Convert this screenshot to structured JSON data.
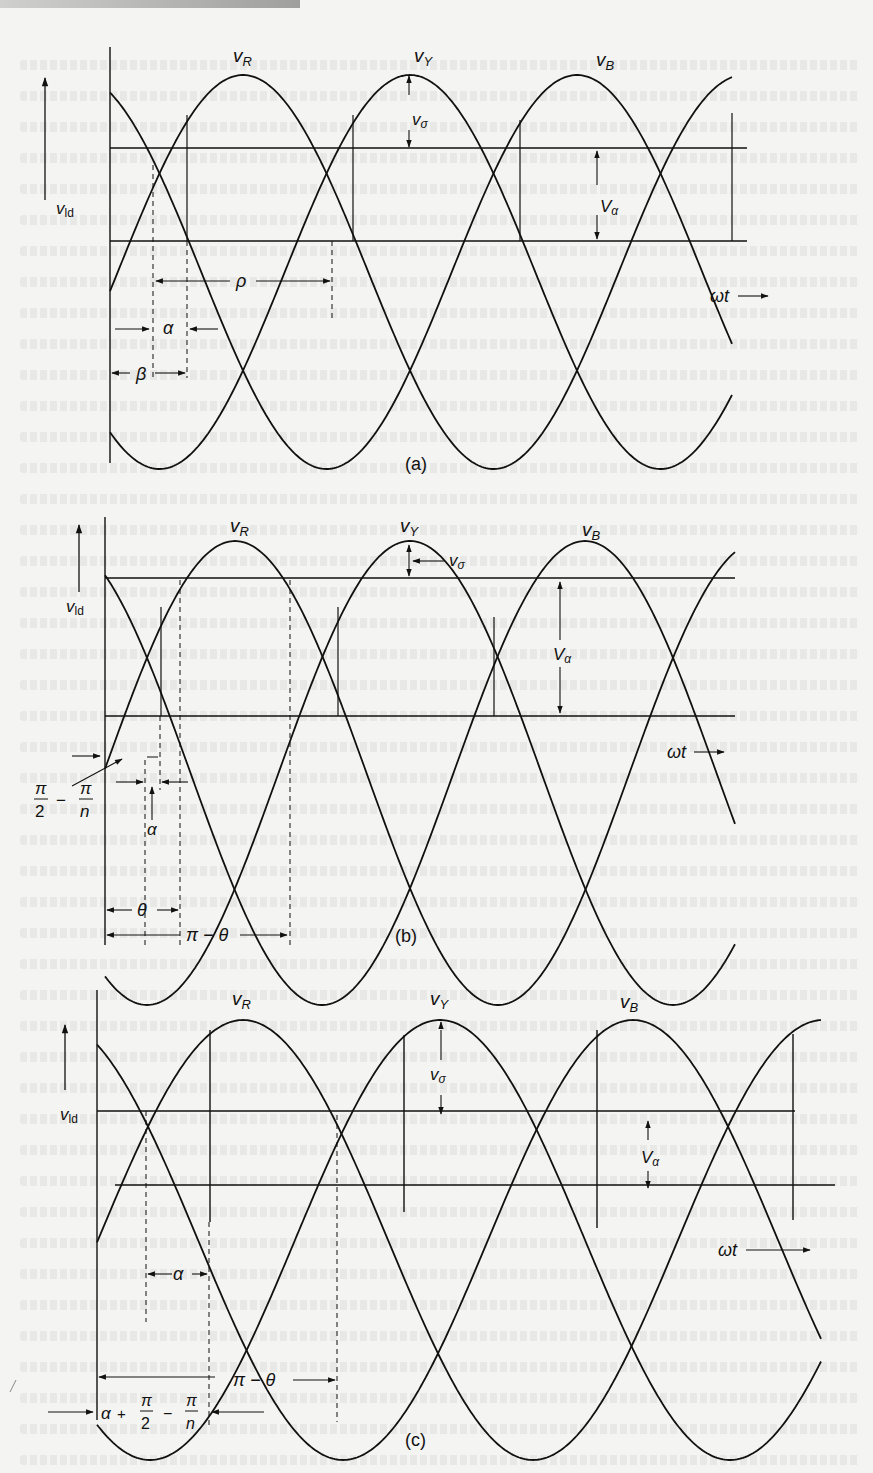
{
  "figure": {
    "stroke_color": "#111111",
    "background_color": "#f4f4f2",
    "panels": [
      {
        "id": "a",
        "caption": "(a)",
        "axis": {
          "x": 110,
          "y_top": 47,
          "y_bottom": 463,
          "arrow_x": 45,
          "arrow_y_top": 75,
          "arrow_y_bottom": 200
        },
        "ylabel": "v_ld",
        "ylabel_pos": [
          66,
          214
        ],
        "wave": {
          "x_start": 110,
          "x_end": 733,
          "center_y": 272,
          "amplitude": 197,
          "period": 501,
          "peaks": [
            243,
            410,
            577
          ]
        },
        "phase_labels": [
          {
            "text": "v",
            "sub": "R",
            "x": 233,
            "y": 62
          },
          {
            "text": "v",
            "sub": "Y",
            "x": 414,
            "y": 62
          },
          {
            "text": "v",
            "sub": "B",
            "x": 596,
            "y": 66
          }
        ],
        "h_lines": [
          {
            "y": 148,
            "x1": 110,
            "x2": 747
          },
          {
            "y": 241,
            "x1": 110,
            "x2": 747
          }
        ],
        "annotations": {
          "v_sigma": "v_σ",
          "V_alpha": "V_α",
          "rho": "ρ",
          "alpha": "α",
          "beta": "β",
          "omega_t": "ωt"
        }
      },
      {
        "id": "b",
        "caption": "(b)",
        "axis": {
          "x": 105,
          "y_top": 517,
          "y_bottom": 945
        },
        "ylabel": "v_ld",
        "ylabel_pos": [
          66,
          612
        ],
        "wave": {
          "x_start": 105,
          "x_end": 735,
          "center_y": 773,
          "amplitude": 232,
          "period": 526,
          "peaks": [
            235,
            410,
            585
          ]
        },
        "phase_labels": [
          {
            "text": "v",
            "sub": "R",
            "x": 230,
            "y": 532
          },
          {
            "text": "v",
            "sub": "Y",
            "x": 400,
            "y": 532
          },
          {
            "text": "v",
            "sub": "B",
            "x": 582,
            "y": 536
          }
        ],
        "h_lines": [
          {
            "y": 578,
            "x1": 105,
            "x2": 735
          },
          {
            "y": 716,
            "x1": 105,
            "x2": 735
          }
        ],
        "annotations": {
          "pi_over_2_minus_pi_over_n": "π/2 − π/n",
          "alpha": "α",
          "theta": "θ",
          "pi_minus_theta": "π − θ",
          "v_sigma": "v_σ",
          "V_alpha": "V_α",
          "omega_t": "ωt"
        }
      },
      {
        "id": "c",
        "caption": "(c)",
        "axis": {
          "x": 97,
          "y_top": 990,
          "y_bottom": 1420
        },
        "ylabel": "v_ld",
        "ylabel_pos": [
          60,
          1120
        ],
        "wave": {
          "x_start": 97,
          "x_end": 822,
          "center_y": 1240,
          "amplitude": 220,
          "period": 580,
          "peaks": [
            243,
            440,
            633
          ]
        },
        "phase_labels": [
          {
            "text": "v",
            "sub": "R",
            "x": 232,
            "y": 1005
          },
          {
            "text": "v",
            "sub": "Y",
            "x": 430,
            "y": 1005
          },
          {
            "text": "v",
            "sub": "B",
            "x": 620,
            "y": 1008
          }
        ],
        "h_lines": [
          {
            "y": 1111,
            "x1": 97,
            "x2": 795
          },
          {
            "y": 1185,
            "x1": 115,
            "x2": 835
          }
        ],
        "annotations": {
          "alpha": "α",
          "pi_minus_theta": "π − θ",
          "alpha_plus": "α + π/2 − π/n",
          "v_sigma": "v_σ",
          "V_alpha": "V_α",
          "omega_t": "ωt"
        }
      }
    ]
  }
}
